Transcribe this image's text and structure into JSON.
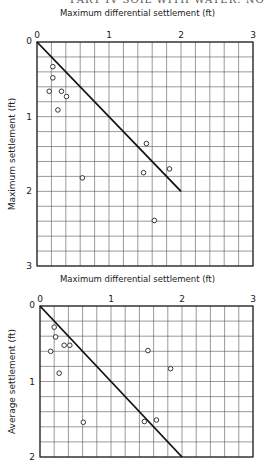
{
  "page_header": "PART IV  SOIL WITH WATER: NO FLOW",
  "chart_data": [
    {
      "type": "scatter",
      "title": "Maximum differential settlement (ft)",
      "xlabel": "Maximum differential settlement (ft)",
      "ylabel": "Maximum settlement (ft)",
      "x_ticks": [
        "0",
        "1",
        "2",
        "3"
      ],
      "y_ticks": [
        "0",
        "1",
        "2",
        "3"
      ],
      "xlim": [
        0,
        3
      ],
      "ylim": [
        0,
        3
      ],
      "y_inverted": true,
      "x_axis_position": "top",
      "grid": true,
      "grid_step": 0.2,
      "line": {
        "x": [
          0,
          2
        ],
        "y": [
          0,
          2
        ]
      },
      "points": [
        {
          "x": 0.22,
          "y": 0.33
        },
        {
          "x": 0.22,
          "y": 0.48
        },
        {
          "x": 0.17,
          "y": 0.66
        },
        {
          "x": 0.34,
          "y": 0.66
        },
        {
          "x": 0.41,
          "y": 0.73
        },
        {
          "x": 0.29,
          "y": 0.91
        },
        {
          "x": 1.52,
          "y": 1.36
        },
        {
          "x": 1.48,
          "y": 1.75
        },
        {
          "x": 1.84,
          "y": 1.7
        },
        {
          "x": 0.63,
          "y": 1.82
        },
        {
          "x": 1.63,
          "y": 2.39
        }
      ]
    },
    {
      "type": "scatter",
      "title": "Maximum differential settlement (ft)",
      "xlabel": "Maximum differential settlement (ft)",
      "ylabel": "Average settlement (ft)",
      "x_ticks": [
        "0",
        "1",
        "2",
        "3"
      ],
      "y_ticks": [
        "0",
        "1",
        "2"
      ],
      "xlim": [
        0,
        3
      ],
      "ylim": [
        0,
        2
      ],
      "y_inverted": true,
      "x_axis_position": "top",
      "grid": true,
      "grid_step": 0.2,
      "line": {
        "x": [
          0,
          2
        ],
        "y": [
          0,
          2
        ]
      },
      "points": [
        {
          "x": 0.2,
          "y": 0.28
        },
        {
          "x": 0.22,
          "y": 0.41
        },
        {
          "x": 0.34,
          "y": 0.52
        },
        {
          "x": 0.42,
          "y": 0.52
        },
        {
          "x": 0.15,
          "y": 0.6
        },
        {
          "x": 1.52,
          "y": 0.59
        },
        {
          "x": 1.84,
          "y": 0.83
        },
        {
          "x": 0.27,
          "y": 0.89
        },
        {
          "x": 0.61,
          "y": 1.54
        },
        {
          "x": 1.47,
          "y": 1.53
        },
        {
          "x": 1.64,
          "y": 1.51
        }
      ]
    }
  ]
}
